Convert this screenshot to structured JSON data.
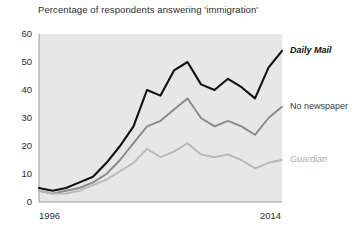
{
  "chart_data": {
    "type": "line",
    "title": "Percentage of respondents answering 'immigration'",
    "xlabel": "",
    "ylabel": "",
    "xlim": [
      1996,
      2014
    ],
    "ylim": [
      0,
      60
    ],
    "yticks": [
      0,
      10,
      20,
      30,
      40,
      50,
      60
    ],
    "xticks": [
      1996,
      2014
    ],
    "xtick_labels": [
      "1996",
      "2014"
    ],
    "ytick_labels": [
      "0",
      "10",
      "20",
      "30",
      "40",
      "50",
      "60"
    ],
    "grid": false,
    "legend_position": "right-inline",
    "x": [
      1996,
      1997,
      1998,
      1999,
      2000,
      2001,
      2002,
      2003,
      2004,
      2005,
      2006,
      2007,
      2008,
      2009,
      2010,
      2011,
      2012,
      2013,
      2014
    ],
    "series": [
      {
        "name": "Daily Mail",
        "color": "#111111",
        "label_style": "italic-bold",
        "values": [
          5,
          4,
          5,
          7,
          9,
          14,
          20,
          27,
          40,
          38,
          47,
          50,
          42,
          40,
          44,
          41,
          37,
          48,
          54
        ]
      },
      {
        "name": "No newspaper",
        "color": "#8a8a8a",
        "label_style": "regular",
        "values": [
          4,
          3,
          4,
          5,
          7,
          10,
          15,
          21,
          27,
          29,
          33,
          37,
          30,
          27,
          29,
          27,
          24,
          30,
          34
        ]
      },
      {
        "name": "Guardian",
        "color": "#b9b9b9",
        "label_style": "italic",
        "values": [
          4,
          3,
          3,
          4,
          6,
          8,
          11,
          14,
          19,
          16,
          18,
          21,
          17,
          16,
          17,
          15,
          12,
          14,
          15
        ]
      }
    ]
  },
  "colors": {
    "plot_background": "#e7e7e7",
    "page_background": "#ffffff",
    "axis": "#9a9a9a",
    "text": "#2b2b2b"
  }
}
